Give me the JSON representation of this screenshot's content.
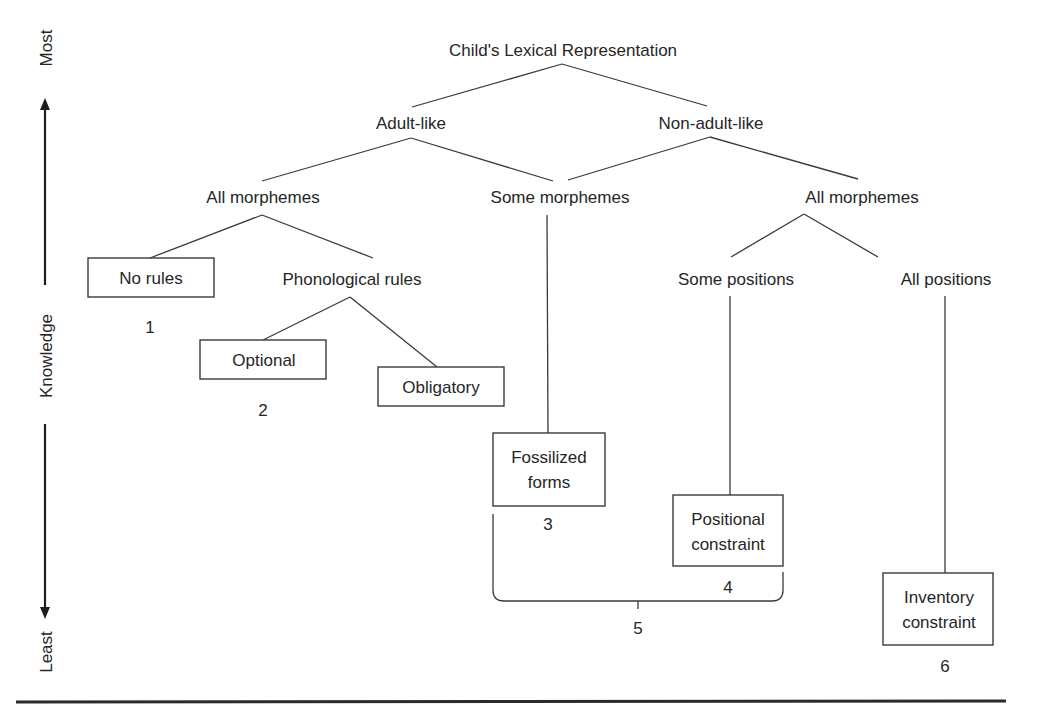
{
  "diagram": {
    "title": "Child's Lexical Representation",
    "axis": {
      "top_label": "Most",
      "middle_label": "Knowledge",
      "bottom_label": "Least"
    },
    "level1": {
      "left": "Adult-like",
      "right": "Non-adult-like"
    },
    "level2": {
      "left": "All morphemes",
      "middle": "Some morphemes",
      "right": "All morphemes"
    },
    "level3": {
      "no_rules": "No rules",
      "phonological_rules": "Phonological rules",
      "some_positions": "Some positions",
      "all_positions": "All positions"
    },
    "leaves": {
      "optional": "Optional",
      "obligatory": "Obligatory",
      "fossilized_line1": "Fossilized",
      "fossilized_line2": "forms",
      "positional_line1": "Positional",
      "positional_line2": "constraint",
      "inventory_line1": "Inventory",
      "inventory_line2": "constraint"
    },
    "numbers": {
      "n1": "1",
      "n2": "2",
      "n3": "3",
      "n4": "4",
      "n5": "5",
      "n6": "6"
    },
    "colors": {
      "line": "#3a3a3a",
      "text": "#262626",
      "background": "#ffffff"
    }
  }
}
